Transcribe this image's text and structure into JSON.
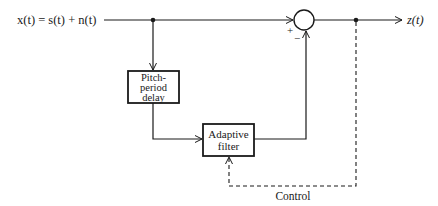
{
  "diagram": {
    "input_label": "x(t) = s(t) + n(t)",
    "output_label": "z(t)",
    "blocks": {
      "pitch_delay": {
        "lines": [
          "Pitch-",
          "period",
          "delay"
        ]
      },
      "adaptive_filter": {
        "lines": [
          "Adaptive",
          "filter"
        ]
      }
    },
    "summer": {
      "plus": "+",
      "minus": "−"
    },
    "control_label": "Control",
    "colors": {
      "line": "#1a1a1a",
      "background": "#ffffff"
    }
  }
}
